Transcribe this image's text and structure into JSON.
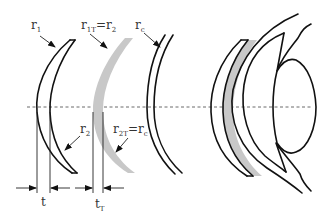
{
  "diagram": {
    "colors": {
      "line": "#111111",
      "tear_lens": "#c8c8c8",
      "background": "#ffffff",
      "text": "#333333"
    },
    "labels": {
      "r1": {
        "base": "r",
        "sub": "1"
      },
      "r1t": {
        "base": "r",
        "sub": "1T",
        "eq": "=",
        "base2": "r",
        "sub2": "2"
      },
      "rc": {
        "base": "r",
        "sub": "c"
      },
      "r2": {
        "base": "r",
        "sub": "2"
      },
      "r2t": {
        "base": "r",
        "sub": "2T",
        "eq": "=",
        "base2": "r",
        "sub2": "c"
      },
      "t": {
        "base": "t"
      },
      "tt": {
        "base": "t",
        "sub": "T"
      }
    },
    "components": [
      "contact-lens",
      "tear-lens",
      "cornea",
      "eye-cross-section"
    ]
  }
}
